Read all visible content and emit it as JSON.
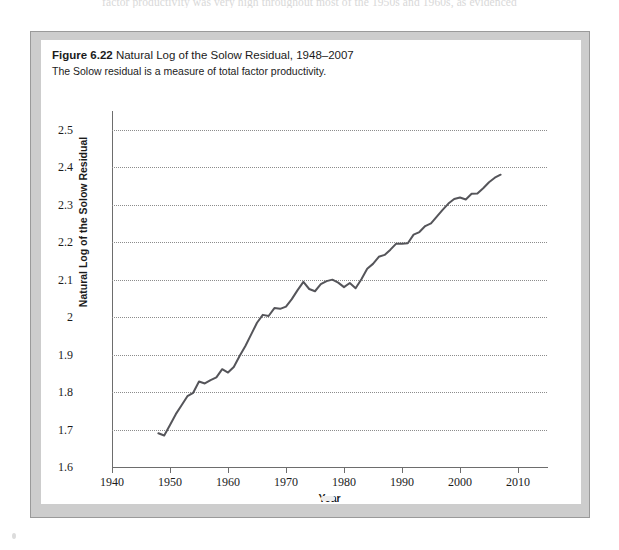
{
  "page": {
    "bleed_text": "factor productivity was very high throughout most of the 1950s and 1960s, as evidenced"
  },
  "figure": {
    "number_label": "Figure 6.22",
    "title": "Natural Log of the Solow Residual, 1948–2007",
    "subtitle": "The Solow residual is a measure of total factor productivity."
  },
  "chart_data": {
    "type": "line",
    "title": "Natural Log of the Solow Residual, 1948–2007",
    "xlabel": "Year",
    "ylabel": "Natural Log of the Solow Residual",
    "xlim": [
      1940,
      2015
    ],
    "ylim": [
      1.6,
      2.55
    ],
    "xticks": [
      1940,
      1950,
      1960,
      1970,
      1980,
      1990,
      2000,
      2010
    ],
    "xtick_labels": [
      "1940",
      "1950",
      "1960",
      "1970",
      "1980",
      "1990",
      "2000",
      "2010"
    ],
    "yticks": [
      1.6,
      1.7,
      1.8,
      1.9,
      2.0,
      2.1,
      2.2,
      2.3,
      2.4,
      2.5
    ],
    "ytick_labels": [
      "1.6",
      "1.7",
      "1.8",
      "1.9",
      "2",
      "2.1",
      "2.2",
      "2.3",
      "2.4",
      "2.5"
    ],
    "grid": "horizontal-dotted",
    "legend": "none",
    "line_color": "#55555a",
    "line_width": 2,
    "series": [
      {
        "name": "Natural Log of the Solow Residual",
        "x": [
          1948,
          1949,
          1950,
          1951,
          1952,
          1953,
          1954,
          1955,
          1956,
          1957,
          1958,
          1959,
          1960,
          1961,
          1962,
          1963,
          1964,
          1965,
          1966,
          1967,
          1968,
          1969,
          1970,
          1971,
          1972,
          1973,
          1974,
          1975,
          1976,
          1977,
          1978,
          1979,
          1980,
          1981,
          1982,
          1983,
          1984,
          1985,
          1986,
          1987,
          1988,
          1989,
          1990,
          1991,
          1992,
          1993,
          1994,
          1995,
          1996,
          1997,
          1998,
          1999,
          2000,
          2001,
          2002,
          2003,
          2004,
          2005,
          2006,
          2007
        ],
        "y": [
          1.69,
          1.684,
          1.712,
          1.741,
          1.765,
          1.789,
          1.798,
          1.828,
          1.823,
          1.832,
          1.839,
          1.861,
          1.852,
          1.867,
          1.896,
          1.923,
          1.954,
          1.985,
          2.006,
          2.003,
          2.024,
          2.022,
          2.028,
          2.048,
          2.072,
          2.094,
          2.075,
          2.069,
          2.088,
          2.096,
          2.1,
          2.092,
          2.08,
          2.091,
          2.077,
          2.101,
          2.129,
          2.142,
          2.161,
          2.166,
          2.18,
          2.196,
          2.196,
          2.197,
          2.22,
          2.227,
          2.243,
          2.25,
          2.268,
          2.286,
          2.303,
          2.315,
          2.319,
          2.314,
          2.329,
          2.33,
          2.344,
          2.36,
          2.372,
          2.38
        ]
      }
    ]
  }
}
